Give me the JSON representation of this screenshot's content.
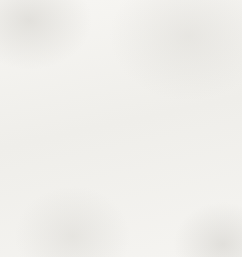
{
  "figure": {
    "width": 242,
    "height": 257,
    "background_color": "#f4f3f0"
  },
  "chart_data": {
    "type": "line",
    "title": "",
    "subtitle": "",
    "xlabel": "",
    "ylabel": "",
    "grid": true,
    "grid_color": "#b9b7b2",
    "grid_spacing_units": 1,
    "legend": "none",
    "axis_color": "#111111",
    "line_color": "#111111",
    "xlim": [
      -3,
      6
    ],
    "ylim": [
      -6,
      3
    ],
    "xticks": [
      -3,
      -2,
      -1,
      0,
      1,
      2,
      3,
      4,
      5,
      6
    ],
    "yticks": [
      -6,
      -5,
      -4,
      -3,
      -2,
      -1,
      0,
      1,
      2,
      3
    ],
    "tick_labels_shown": false,
    "axes": [
      {
        "name": "x-axis",
        "orientation": "horizontal",
        "position_value": 0,
        "arrow_end": "right"
      },
      {
        "name": "y-axis",
        "orientation": "vertical",
        "position_value": 0,
        "arrow_end": "up"
      }
    ],
    "series": [
      {
        "name": "line",
        "equation": "y = (2/3)x - 3",
        "slope": 0.667,
        "y_intercept": -3,
        "x_intercept": 4.5,
        "x": [
          -3,
          6
        ],
        "values": [
          -5,
          1
        ],
        "points": [
          {
            "x": -3,
            "y": -5
          },
          {
            "x": 0,
            "y": -3
          },
          {
            "x": 4.5,
            "y": 0
          },
          {
            "x": 6,
            "y": 1
          }
        ]
      }
    ]
  },
  "geometry": {
    "grid_left_px": 13,
    "grid_top_px": 22,
    "grid_right_px": 228,
    "grid_bottom_px": 243,
    "cell_px": 23.9,
    "origin_x_px": 82,
    "origin_y_px": 91,
    "columns": 9,
    "rows": 9,
    "line_start_px": {
      "x": 13,
      "y": 199
    },
    "line_end_px": {
      "x": 228,
      "y": 52
    },
    "x_axis_arrow_tip_px": {
      "x": 241,
      "y": 91
    },
    "y_axis_arrow_tip_px": {
      "x": 82,
      "y": 4
    }
  }
}
